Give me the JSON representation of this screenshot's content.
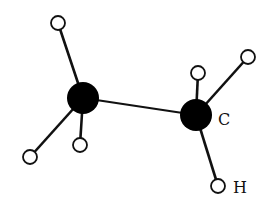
{
  "diagram": {
    "type": "ball-and-stick molecule",
    "colors": {
      "carbon": "#000000",
      "hydrogen_fill": "#ffffff",
      "stroke": "#111111",
      "background": "#ffffff"
    },
    "atoms": [
      {
        "id": "c1",
        "element": "C",
        "x": 83,
        "y": 98,
        "r": 16
      },
      {
        "id": "c2",
        "element": "C",
        "x": 196,
        "y": 115,
        "r": 16
      },
      {
        "id": "h1",
        "element": "H",
        "x": 58,
        "y": 23,
        "r": 7
      },
      {
        "id": "h2",
        "element": "H",
        "x": 30,
        "y": 157,
        "r": 7
      },
      {
        "id": "h3",
        "element": "H",
        "x": 80,
        "y": 145,
        "r": 7
      },
      {
        "id": "h4",
        "element": "H",
        "x": 198,
        "y": 73,
        "r": 7
      },
      {
        "id": "h5",
        "element": "H",
        "x": 248,
        "y": 57,
        "r": 7
      },
      {
        "id": "h6",
        "element": "H",
        "x": 218,
        "y": 186,
        "r": 7
      }
    ],
    "bonds": [
      [
        "c1",
        "c2"
      ],
      [
        "c1",
        "h1"
      ],
      [
        "c1",
        "h2"
      ],
      [
        "c1",
        "h3"
      ],
      [
        "c2",
        "h4"
      ],
      [
        "c2",
        "h5"
      ],
      [
        "c2",
        "h6"
      ]
    ],
    "labels": [
      {
        "text": "C",
        "x": 218,
        "y": 125
      },
      {
        "text": "H",
        "x": 233,
        "y": 193
      }
    ]
  }
}
